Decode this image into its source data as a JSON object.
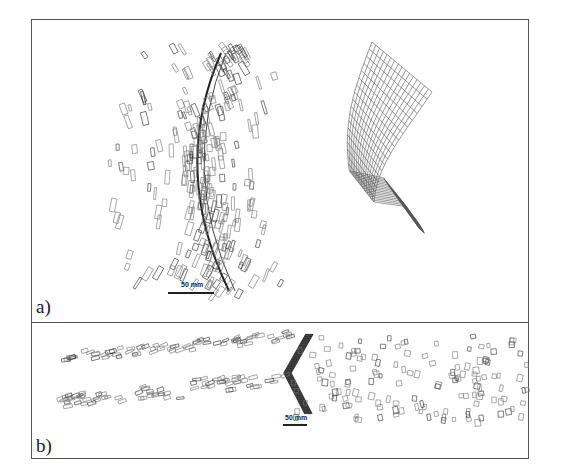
{
  "figure": {
    "panels": [
      {
        "label": "a)",
        "scale_bar": {
          "text": "50 mm"
        },
        "description": "Scattered rectangular markers along a curved shock front with a deformed mesh surface on the right"
      },
      {
        "label": "b)",
        "scale_bar": {
          "text": "50 mm"
        },
        "description": "Scattered rectangular markers with a chevron-shaped dense front"
      }
    ]
  },
  "colors": {
    "frame": "#555555",
    "ink": "#222222",
    "marker": "#666666",
    "background": "#ffffff"
  }
}
